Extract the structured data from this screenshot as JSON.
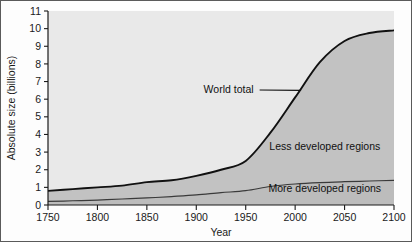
{
  "chart_data": {
    "type": "area",
    "title": "",
    "xlabel": "Year",
    "ylabel": "Absolute size (billions)",
    "xlim": [
      1750,
      2100
    ],
    "ylim": [
      0,
      11
    ],
    "grid": false,
    "legend_position": "inline-annotations",
    "xticks": [
      1750,
      1800,
      1850,
      1900,
      1950,
      2000,
      2050,
      2100
    ],
    "xtick_labels": [
      "1750",
      "1800",
      "1850",
      "1900",
      "1950",
      "2000",
      "2050",
      "2100"
    ],
    "yticks": [
      0,
      1,
      2,
      3,
      4,
      5,
      6,
      7,
      8,
      9,
      10,
      11
    ],
    "ytick_labels": [
      "0",
      "1",
      "2",
      "3",
      "4",
      "5",
      "6",
      "7",
      "8",
      "9",
      "10",
      "11"
    ],
    "x": [
      1750,
      1775,
      1800,
      1825,
      1850,
      1875,
      1900,
      1925,
      1950,
      1975,
      2000,
      2025,
      2050,
      2075,
      2100
    ],
    "series": [
      {
        "name": "World total",
        "values": [
          0.8,
          0.9,
          1.0,
          1.1,
          1.3,
          1.4,
          1.65,
          2.0,
          2.5,
          4.1,
          6.1,
          8.1,
          9.3,
          9.75,
          9.9
        ]
      },
      {
        "name": "More developed regions",
        "values": [
          0.2,
          0.24,
          0.28,
          0.34,
          0.4,
          0.48,
          0.57,
          0.7,
          0.81,
          1.05,
          1.19,
          1.27,
          1.32,
          1.36,
          1.4
        ]
      }
    ],
    "band_labels": [
      {
        "name": "Less developed regions",
        "x": 2030,
        "y": 3.1
      },
      {
        "name": "More developed regions",
        "x": 2030,
        "y": 0.72
      }
    ],
    "annotations": [
      {
        "name": "World total",
        "text_x": 1958,
        "text_y": 6.55,
        "point_x": 2006,
        "point_y": 6.5
      }
    ],
    "colors": {
      "upper_band_fill": "#c2c2c2",
      "lower_band_fill": "#bcbcbc",
      "plot_background": "#e9e9e9",
      "world_total_line": "#111111",
      "more_developed_line": "#3a3a3a",
      "axis": "#1a1a1a",
      "figure_background": "#fdfdfd",
      "figure_border": "#5a5a5a"
    }
  }
}
